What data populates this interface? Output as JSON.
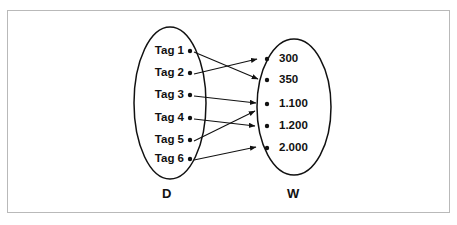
{
  "figure": {
    "type": "set-mapping-diagram",
    "border_color": "#b9b9b9",
    "background": "#ffffff",
    "ink_color": "#111111"
  },
  "sets": {
    "domain": {
      "label": "D",
      "ellipse": {
        "cx": 170,
        "cy": 103,
        "rx": 36,
        "ry": 76
      },
      "elements": [
        {
          "id": "tag-1",
          "label": "Tag 1",
          "x": 190,
          "y": 51
        },
        {
          "id": "tag-2",
          "label": "Tag 2",
          "x": 190,
          "y": 73
        },
        {
          "id": "tag-3",
          "label": "Tag 3",
          "x": 190,
          "y": 95
        },
        {
          "id": "tag-4",
          "label": "Tag 4",
          "x": 190,
          "y": 118
        },
        {
          "id": "tag-5",
          "label": "Tag 5",
          "x": 190,
          "y": 140
        },
        {
          "id": "tag-6",
          "label": "Tag 6",
          "x": 190,
          "y": 159
        }
      ]
    },
    "codomain": {
      "label": "W",
      "ellipse": {
        "cx": 294,
        "cy": 107,
        "rx": 37,
        "ry": 68
      },
      "elements": [
        {
          "id": "w-300",
          "label": "300",
          "x": 267,
          "y": 59
        },
        {
          "id": "w-350",
          "label": "350",
          "x": 267,
          "y": 80
        },
        {
          "id": "w-1100",
          "label": "1.100",
          "x": 267,
          "y": 104
        },
        {
          "id": "w-1200",
          "label": "1.200",
          "x": 267,
          "y": 126
        },
        {
          "id": "w-2000",
          "label": "2.000",
          "x": 267,
          "y": 148
        }
      ]
    }
  },
  "mappings": [
    {
      "from": "tag-1",
      "to": "w-350",
      "x1": 194,
      "y1": 52,
      "x2": 258,
      "y2": 79
    },
    {
      "from": "tag-2",
      "to": "w-300",
      "x1": 194,
      "y1": 74,
      "x2": 257,
      "y2": 59
    },
    {
      "from": "tag-3",
      "to": "w-1100",
      "x1": 194,
      "y1": 96,
      "x2": 256,
      "y2": 103
    },
    {
      "from": "tag-4",
      "to": "w-1200",
      "x1": 194,
      "y1": 119,
      "x2": 255,
      "y2": 126
    },
    {
      "from": "tag-5",
      "to": "w-1100",
      "x1": 194,
      "y1": 141,
      "x2": 255,
      "y2": 111
    },
    {
      "from": "tag-6",
      "to": "w-2000",
      "x1": 194,
      "y1": 160,
      "x2": 256,
      "y2": 147
    }
  ],
  "chart_data": {
    "type": "diagram",
    "title": "",
    "domain_label": "D",
    "codomain_label": "W",
    "domain_items": [
      "Tag 1",
      "Tag 2",
      "Tag 3",
      "Tag 4",
      "Tag 5",
      "Tag 6"
    ],
    "codomain_items": [
      "300",
      "350",
      "1.100",
      "1.200",
      "2.000"
    ],
    "edges": [
      [
        "Tag 1",
        "350"
      ],
      [
        "Tag 2",
        "300"
      ],
      [
        "Tag 3",
        "1.100"
      ],
      [
        "Tag 4",
        "1.200"
      ],
      [
        "Tag 5",
        "1.100"
      ],
      [
        "Tag 6",
        "2.000"
      ]
    ]
  }
}
